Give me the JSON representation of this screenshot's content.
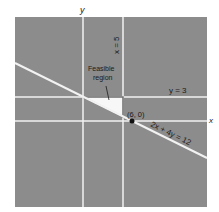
{
  "diagram": {
    "axes": {
      "x_label": "x",
      "y_label": "y"
    },
    "lines": {
      "vertical_constraint": "x = 5",
      "horizontal_constraint": "y = 3",
      "slanted_constraint": "2x + 4y = 12"
    },
    "region_label_line1": "Feasible",
    "region_label_line2": "region",
    "point_label": "(6, 0)",
    "colors": {
      "background": "#8c8c8c",
      "grid_lines": "#f2f2f2",
      "region_fill": "#f7f7f7",
      "region_border": "#6e6e6e",
      "point": "#111111"
    }
  }
}
